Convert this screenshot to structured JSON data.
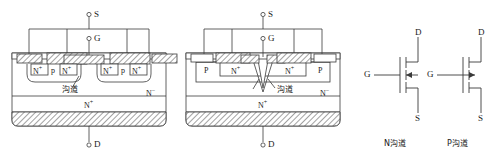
{
  "figure": {
    "type": "semiconductor-device-cross-section-and-symbols",
    "stroke_color": "#3a3a3a",
    "hatch_color": "#555555",
    "background": "#ffffff"
  },
  "diagram_left": {
    "name": "VDMOS planar power MOSFET cross-section",
    "terminals": {
      "source": "S",
      "gate": "G",
      "drain": "D"
    },
    "regions": {
      "source_n_plus": "N",
      "source_n_plus_sup": "+",
      "body_p": "p",
      "epi_n_minus": "N",
      "epi_n_minus_sup": "−",
      "substrate_n_plus": "N",
      "substrate_n_plus_sup": "+"
    },
    "annotations": {
      "channel": "沟道"
    },
    "cell_labels": [
      {
        "left": "N",
        "left_sup": "+",
        "middle": "p",
        "right": "N",
        "right_sup": "+"
      },
      {
        "left": "N",
        "left_sup": "+",
        "middle": "p",
        "right": "N",
        "right_sup": "+"
      }
    ]
  },
  "diagram_middle": {
    "name": "VMOS V-groove power MOSFET cross-section",
    "terminals": {
      "source": "S",
      "gate": "G",
      "drain": "D"
    },
    "regions": {
      "body_p_left": "P",
      "body_p_right": "P",
      "source_n_plus_left": "N",
      "source_n_plus_left_sup": "+",
      "source_n_plus_right": "N",
      "source_n_plus_right_sup": "+",
      "epi_n_minus": "N",
      "epi_n_minus_sup": "−",
      "substrate_n_plus": "N",
      "substrate_n_plus_sup": "+"
    },
    "annotations": {
      "channel": "沟道"
    }
  },
  "symbols": [
    {
      "id": "n-channel-mosfet",
      "caption": "N沟道",
      "drain": "D",
      "gate": "G",
      "source": "S",
      "arrow_direction": "inward"
    },
    {
      "id": "p-channel-mosfet",
      "caption": "P沟道",
      "drain": "D",
      "gate": "G",
      "source": "S",
      "arrow_direction": "outward"
    }
  ]
}
